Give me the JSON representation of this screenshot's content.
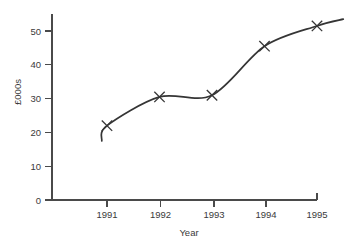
{
  "chart_data": {
    "type": "line",
    "title": "",
    "subtitle": "",
    "xlabel": "Year",
    "ylabel": "£000s",
    "x": [
      1991,
      1992,
      1993,
      1994,
      1995
    ],
    "categories": [
      "1991",
      "1992",
      "1993",
      "1994",
      "1995"
    ],
    "values": [
      22,
      30.5,
      31,
      45.5,
      51.5
    ],
    "series": [
      {
        "name": "Turnover",
        "values": [
          22,
          30.5,
          31,
          45.5,
          51.5
        ]
      }
    ],
    "xlim": [
      1990.85,
      1995.55
    ],
    "ylim": [
      0,
      56
    ],
    "xticks": [
      1991,
      1992,
      1993,
      1994,
      1995
    ],
    "xtick_labels": [
      "1991",
      "1992",
      "1993",
      "1994",
      "1995"
    ],
    "yticks": [
      0,
      10,
      20,
      30,
      40,
      50
    ],
    "ytick_labels": [
      "0",
      "10",
      "20",
      "30",
      "40",
      "50"
    ],
    "grid": false,
    "legend": false,
    "legend_position": "none",
    "marker_style": "x",
    "line_color": "#353535",
    "axis_color": "#4a4a4a",
    "text_color": "#3a3a3a",
    "background_color": "#ffffff",
    "curve_start": {
      "x": 1990.9,
      "y": 17.5
    },
    "curve_end": {
      "x": 1995.5,
      "y": 53.5
    },
    "annotations": []
  },
  "axes": {
    "y_title": "£000s",
    "x_title": "Year",
    "y_ticks": [
      {
        "label": "50",
        "value": 50
      },
      {
        "label": "40",
        "value": 40
      },
      {
        "label": "30",
        "value": 30
      },
      {
        "label": "20",
        "value": 20
      },
      {
        "label": "10",
        "value": 10
      },
      {
        "label": "0",
        "value": 0
      }
    ],
    "x_ticks": [
      {
        "label": "1991",
        "value": 1991
      },
      {
        "label": "1992",
        "value": 1992
      },
      {
        "label": "1993",
        "value": 1993
      },
      {
        "label": "1994",
        "value": 1994
      },
      {
        "label": "1995",
        "value": 1995
      }
    ]
  }
}
